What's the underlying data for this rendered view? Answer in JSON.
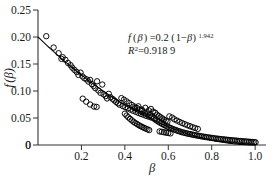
{
  "chart_data": {
    "type": "scatter",
    "title": "",
    "xlabel": "β",
    "ylabel": "f (β)",
    "xlim": [
      0,
      1.05
    ],
    "ylim": [
      0,
      0.25
    ],
    "grid": false,
    "legend": null,
    "x_ticks": [
      0,
      0.2,
      0.4,
      0.6,
      0.8,
      1.0
    ],
    "x_tick_labels": [
      "0",
      "0.2",
      "0.4",
      "0.6",
      "0.8",
      "1.0"
    ],
    "y_ticks": [
      0,
      0.05,
      0.1,
      0.15,
      0.2,
      0.25
    ],
    "y_tick_labels": [
      "0",
      "0.05",
      "0.10",
      "0.15",
      "0.20",
      "0.25"
    ],
    "marker": "open-circle",
    "marker_color": "#000000",
    "marker_size_px": 3.6,
    "fit_line_color": "#000000",
    "fit": {
      "expression": "f(β) = 0.2 (1−β)^1.942",
      "coefficient": 0.2,
      "exponent": 1.942,
      "r_squared": 0.9189,
      "x_start": 0,
      "x_end": 1.0
    },
    "series": [
      {
        "name": "observations",
        "points": [
          [
            0.038,
            0.2015
          ],
          [
            0.072,
            0.1805
          ],
          [
            0.095,
            0.17
          ],
          [
            0.108,
            0.1595
          ],
          [
            0.114,
            0.1625
          ],
          [
            0.126,
            0.1578
          ],
          [
            0.138,
            0.152
          ],
          [
            0.15,
            0.1478
          ],
          [
            0.158,
            0.1432
          ],
          [
            0.168,
            0.139
          ],
          [
            0.178,
            0.1352
          ],
          [
            0.186,
            0.1298
          ],
          [
            0.196,
            0.134
          ],
          [
            0.205,
            0.127
          ],
          [
            0.214,
            0.1235
          ],
          [
            0.224,
            0.1215
          ],
          [
            0.232,
            0.1175
          ],
          [
            0.24,
            0.1205
          ],
          [
            0.248,
            0.1128
          ],
          [
            0.256,
            0.1092
          ],
          [
            0.264,
            0.1052
          ],
          [
            0.272,
            0.118
          ],
          [
            0.278,
            0.101
          ],
          [
            0.288,
            0.0965
          ],
          [
            0.296,
            0.112
          ],
          [
            0.302,
            0.0938
          ],
          [
            0.312,
            0.0906
          ],
          [
            0.318,
            0.0862
          ],
          [
            0.326,
            0.0948
          ],
          [
            0.334,
            0.0885
          ],
          [
            0.206,
            0.0858
          ],
          [
            0.222,
            0.0802
          ],
          [
            0.24,
            0.075
          ],
          [
            0.258,
            0.0712
          ],
          [
            0.27,
            0.0705
          ],
          [
            0.344,
            0.0852
          ],
          [
            0.352,
            0.0824
          ],
          [
            0.36,
            0.0796
          ],
          [
            0.368,
            0.077
          ],
          [
            0.376,
            0.0745
          ],
          [
            0.384,
            0.0868
          ],
          [
            0.39,
            0.0722
          ],
          [
            0.396,
            0.084
          ],
          [
            0.402,
            0.07
          ],
          [
            0.408,
            0.0808
          ],
          [
            0.414,
            0.0678
          ],
          [
            0.42,
            0.0776
          ],
          [
            0.426,
            0.0655
          ],
          [
            0.432,
            0.0742
          ],
          [
            0.438,
            0.0634
          ],
          [
            0.444,
            0.0712
          ],
          [
            0.45,
            0.0614
          ],
          [
            0.456,
            0.0684
          ],
          [
            0.462,
            0.0594
          ],
          [
            0.468,
            0.0658
          ],
          [
            0.474,
            0.0576
          ],
          [
            0.48,
            0.063
          ],
          [
            0.486,
            0.0558
          ],
          [
            0.492,
            0.0604
          ],
          [
            0.498,
            0.054
          ],
          [
            0.504,
            0.058
          ],
          [
            0.51,
            0.0524
          ],
          [
            0.516,
            0.0556
          ],
          [
            0.522,
            0.0508
          ],
          [
            0.528,
            0.0534
          ],
          [
            0.534,
            0.0492
          ],
          [
            0.4,
            0.058
          ],
          [
            0.408,
            0.0545
          ],
          [
            0.416,
            0.0512
          ],
          [
            0.424,
            0.0484
          ],
          [
            0.432,
            0.0456
          ],
          [
            0.44,
            0.043
          ],
          [
            0.448,
            0.0408
          ],
          [
            0.456,
            0.0388
          ],
          [
            0.464,
            0.0368
          ],
          [
            0.472,
            0.035
          ],
          [
            0.48,
            0.0334
          ],
          [
            0.488,
            0.0318
          ],
          [
            0.496,
            0.0304
          ],
          [
            0.504,
            0.029
          ],
          [
            0.512,
            0.0276
          ],
          [
            0.446,
            0.0682
          ],
          [
            0.462,
            0.0716
          ],
          [
            0.478,
            0.0656
          ],
          [
            0.494,
            0.0688
          ],
          [
            0.51,
            0.064
          ],
          [
            0.52,
            0.0668
          ],
          [
            0.53,
            0.0618
          ],
          [
            0.54,
            0.0596
          ],
          [
            0.548,
            0.0562
          ],
          [
            0.556,
            0.0538
          ],
          [
            0.564,
            0.0516
          ],
          [
            0.572,
            0.0494
          ],
          [
            0.58,
            0.0472
          ],
          [
            0.588,
            0.0452
          ],
          [
            0.596,
            0.0434
          ],
          [
            0.54,
            0.047
          ],
          [
            0.548,
            0.0448
          ],
          [
            0.556,
            0.0428
          ],
          [
            0.564,
            0.0408
          ],
          [
            0.572,
            0.039
          ],
          [
            0.58,
            0.0372
          ],
          [
            0.588,
            0.0356
          ],
          [
            0.596,
            0.034
          ],
          [
            0.604,
            0.0326
          ],
          [
            0.612,
            0.0312
          ],
          [
            0.62,
            0.0298
          ],
          [
            0.628,
            0.0286
          ],
          [
            0.636,
            0.0274
          ],
          [
            0.644,
            0.0262
          ],
          [
            0.652,
            0.0252
          ],
          [
            0.56,
            0.0252
          ],
          [
            0.57,
            0.0244
          ],
          [
            0.58,
            0.0236
          ],
          [
            0.59,
            0.0228
          ],
          [
            0.6,
            0.0222
          ],
          [
            0.61,
            0.0215
          ],
          [
            0.605,
            0.053
          ],
          [
            0.618,
            0.0508
          ],
          [
            0.628,
            0.0476
          ],
          [
            0.64,
            0.0452
          ],
          [
            0.652,
            0.0428
          ],
          [
            0.664,
            0.0406
          ],
          [
            0.676,
            0.0386
          ],
          [
            0.688,
            0.0366
          ],
          [
            0.7,
            0.0348
          ],
          [
            0.712,
            0.033
          ],
          [
            0.724,
            0.0314
          ],
          [
            0.736,
            0.0298
          ],
          [
            0.66,
            0.024
          ],
          [
            0.668,
            0.0232
          ],
          [
            0.676,
            0.0224
          ],
          [
            0.684,
            0.0216
          ],
          [
            0.692,
            0.0208
          ],
          [
            0.7,
            0.0202
          ],
          [
            0.708,
            0.0195
          ],
          [
            0.716,
            0.0188
          ],
          [
            0.724,
            0.0182
          ],
          [
            0.732,
            0.0176
          ],
          [
            0.74,
            0.017
          ],
          [
            0.748,
            0.0164
          ],
          [
            0.756,
            0.0158
          ],
          [
            0.764,
            0.0153
          ],
          [
            0.772,
            0.0148
          ],
          [
            0.78,
            0.0143
          ],
          [
            0.788,
            0.0138
          ],
          [
            0.796,
            0.0133
          ],
          [
            0.804,
            0.0129
          ],
          [
            0.812,
            0.0124
          ],
          [
            0.82,
            0.012
          ],
          [
            0.828,
            0.0116
          ],
          [
            0.836,
            0.0112
          ],
          [
            0.844,
            0.0108
          ],
          [
            0.852,
            0.0105
          ],
          [
            0.86,
            0.0101
          ],
          [
            0.868,
            0.0098
          ],
          [
            0.876,
            0.0094
          ],
          [
            0.884,
            0.0091
          ],
          [
            0.892,
            0.0088
          ],
          [
            0.9,
            0.0085
          ],
          [
            0.908,
            0.0082
          ],
          [
            0.916,
            0.0079
          ],
          [
            0.924,
            0.0076
          ],
          [
            0.932,
            0.0073
          ],
          [
            0.94,
            0.0071
          ],
          [
            0.948,
            0.0068
          ],
          [
            0.956,
            0.0065
          ],
          [
            0.964,
            0.0063
          ],
          [
            0.972,
            0.006
          ],
          [
            0.98,
            0.0058
          ],
          [
            0.988,
            0.0055
          ],
          [
            0.996,
            0.0053
          ],
          [
            1.002,
            0.005
          ]
        ]
      }
    ],
    "annotations": [
      {
        "name": "fit-equation",
        "text": "f (β) =0.2 (1−β) 1.942",
        "x": 0.46,
        "y": 0.215
      },
      {
        "name": "r-squared",
        "text": "R2=0.918 9",
        "x": 0.46,
        "y": 0.196
      }
    ]
  },
  "equation": {
    "f_open": "f",
    "paren_open_1": "(",
    "beta_1": "β",
    "paren_close_1": ")",
    "equals": "=0.2",
    "paren_open_2": "(",
    "one_minus": "1−",
    "beta_2": "β",
    "paren_close_2": ")",
    "exponent": "1.942"
  },
  "r_squared_line": {
    "r_symbol": "R",
    "sup": "2",
    "value": "=0.918 9"
  },
  "axes": {
    "x_title": "β",
    "y_title_f": "f",
    "y_title_paren_open": "(",
    "y_title_beta": "β",
    "y_title_paren_close": ")"
  }
}
